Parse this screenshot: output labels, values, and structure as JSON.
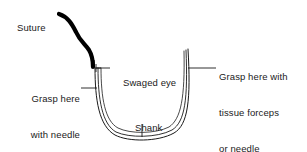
{
  "diagram": {
    "background_color": "#ffffff",
    "line_color": "#1a1a1a",
    "suture_color": "#000000",
    "labels": {
      "suture": "Suture",
      "needle_holder_line1": "Grasp here",
      "needle_holder_line2": "with needle",
      "needle_holder_line3": "holder",
      "swaged_eye": "Swaged eye",
      "tissue_forceps_line1": "Grasp here with",
      "tissue_forceps_line2": "tissue forceps",
      "tissue_forceps_line3": "or needle",
      "shank": "Shank"
    }
  }
}
